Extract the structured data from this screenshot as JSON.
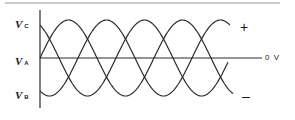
{
  "diagram": {
    "labels": {
      "vc": {
        "main": "V",
        "sub": "C"
      },
      "va": {
        "main": "V",
        "sub": "A"
      },
      "vb": {
        "main": "V",
        "sub": "B"
      },
      "plus": "+",
      "minus": "–",
      "zero": "0 V"
    },
    "geometry": {
      "axis_x": 40,
      "zero_y": 58,
      "amplitude": 38,
      "period_px": 114,
      "x_start": 40,
      "x_end": [
        233,
        230,
        228
      ]
    },
    "phases": [
      {
        "name": "VA",
        "phase_deg": 0
      },
      {
        "name": "VB",
        "phase_deg": -120
      },
      {
        "name": "VC",
        "phase_deg": 120
      }
    ],
    "colors": {
      "stroke": "#2a2a2a",
      "border": "#9a9a9a",
      "background": "#ffffff"
    }
  }
}
